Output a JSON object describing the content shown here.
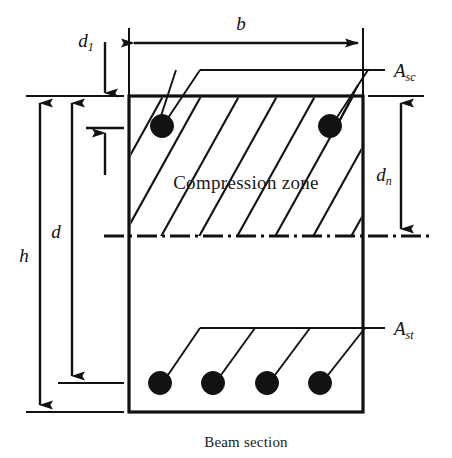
{
  "figure": {
    "caption": "Beam section",
    "zone_label": "Compression zone"
  },
  "dimensions": {
    "width_symbol": "b",
    "width_symbol_sub": "",
    "overall_depth_symbol": "h",
    "effective_depth_symbol": "d",
    "cover_symbol": "d",
    "cover_symbol_sub": "1",
    "neutral_axis_depth_symbol": "d",
    "neutral_axis_depth_sub": "n"
  },
  "reinforcement": {
    "compression_steel_symbol": "A",
    "compression_steel_sub": "sc",
    "tension_steel_symbol": "A",
    "tension_steel_sub": "st",
    "top_bar_count": 2,
    "bottom_bar_count": 4
  },
  "colors": {
    "ink": "#111111",
    "background": "#ffffff",
    "rebar_fill": "#121212"
  },
  "geometry": {
    "beam_left": 129,
    "beam_right": 363,
    "beam_top": 96,
    "beam_bottom": 412,
    "neutral_axis_y": 236,
    "top_bar_y": 126,
    "bottom_bar_y": 383,
    "top_bars_x": [
      162,
      330
    ],
    "bottom_bars_x": [
      160,
      213,
      267,
      320
    ],
    "bar_radius": 11
  }
}
